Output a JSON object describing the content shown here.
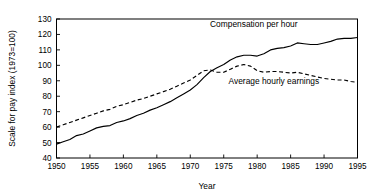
{
  "chart_data": {
    "type": "line",
    "title": "",
    "xlabel": "Year",
    "ylabel": "Scale for pay index (1973=100)",
    "xlim": [
      1950,
      1995
    ],
    "ylim": [
      40,
      130
    ],
    "xticks": [
      1950,
      1955,
      1960,
      1965,
      1970,
      1975,
      1980,
      1985,
      1990,
      1995
    ],
    "yticks": [
      40,
      50,
      60,
      70,
      80,
      90,
      100,
      110,
      120,
      130
    ],
    "grid": false,
    "legend_position": "inline-annotation",
    "x": [
      1950,
      1951,
      1952,
      1953,
      1954,
      1955,
      1956,
      1957,
      1958,
      1959,
      1960,
      1961,
      1962,
      1963,
      1964,
      1965,
      1966,
      1967,
      1968,
      1969,
      1970,
      1971,
      1972,
      1973,
      1974,
      1975,
      1976,
      1977,
      1978,
      1979,
      1980,
      1981,
      1982,
      1983,
      1984,
      1985,
      1986,
      1987,
      1988,
      1989,
      1990,
      1991,
      1992,
      1993,
      1994,
      1995
    ],
    "series": [
      {
        "name": "Compensation per hour",
        "style": "solid",
        "color": "#000000",
        "values": [
          49.0,
          50.5,
          52.0,
          54.5,
          55.5,
          57.5,
          59.5,
          60.5,
          61.0,
          63.0,
          64.0,
          65.5,
          67.5,
          69.0,
          71.0,
          72.5,
          74.5,
          76.5,
          79.0,
          81.5,
          84.0,
          87.5,
          92.0,
          96.0,
          98.5,
          100.5,
          103.5,
          105.5,
          106.5,
          106.5,
          106.0,
          107.5,
          110.0,
          111.0,
          111.5,
          112.5,
          114.5,
          114.0,
          113.5,
          113.5,
          114.5,
          115.5,
          117.0,
          117.5,
          117.5,
          118.0
        ]
      },
      {
        "name": "Average hourly earnings",
        "style": "dashed",
        "color": "#000000",
        "values": [
          60.0,
          61.5,
          63.0,
          64.5,
          66.0,
          67.5,
          69.0,
          70.5,
          71.5,
          73.5,
          74.5,
          76.0,
          77.5,
          78.5,
          80.0,
          81.5,
          83.0,
          84.5,
          86.5,
          88.5,
          90.5,
          93.5,
          96.5,
          97.0,
          95.5,
          95.5,
          97.5,
          99.5,
          100.5,
          99.5,
          96.5,
          95.5,
          96.0,
          96.0,
          95.5,
          95.0,
          95.5,
          94.5,
          93.5,
          92.5,
          91.5,
          91.0,
          90.5,
          90.5,
          89.5,
          89.0
        ]
      }
    ],
    "annotations": [
      {
        "text": "Compensation per hour",
        "x": 1979.5,
        "y": 124.5
      },
      {
        "text": "Average hourly earnings",
        "x": 1982.5,
        "y": 88.0
      }
    ]
  }
}
